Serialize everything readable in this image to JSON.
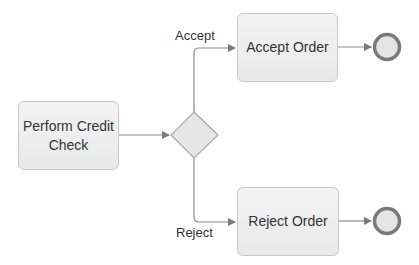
{
  "diagram": {
    "type": "BPMN process",
    "colors": {
      "task_fill": "#eeeeee",
      "task_border": "#c9c9c9",
      "connector": "#8a8a8a",
      "end_event_ring": "#7a7a7a",
      "end_event_fill": "#e4e4e4",
      "text": "#333333"
    },
    "tasks": {
      "perform_credit_check": "Perform Credit Check",
      "accept_order": "Accept Order",
      "reject_order": "Reject Order"
    },
    "gateway": {
      "kind": "exclusive-gateway"
    },
    "flows": {
      "accept_label": "Accept",
      "reject_label": "Reject"
    },
    "end_events": [
      "end-accept",
      "end-reject"
    ]
  }
}
